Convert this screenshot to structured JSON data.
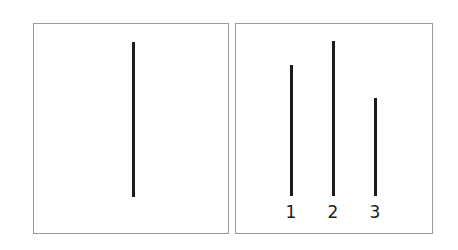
{
  "figure": {
    "background_color": "#ffffff",
    "line_color": "#1c1c1c",
    "panel_border_color": "#9a9a9a",
    "canvas": {
      "width": 458,
      "height": 250
    }
  },
  "panels": [
    {
      "id": "standard",
      "name": "standard-panel",
      "x": 33,
      "y": 23,
      "width": 196,
      "height": 211,
      "lines": [
        {
          "id": "standard-line",
          "label": "",
          "x": 132,
          "top": 42,
          "bottom": 197,
          "length": 155,
          "thickness": 3
        }
      ]
    },
    {
      "id": "comparison",
      "name": "comparison-panel",
      "x": 235,
      "y": 23,
      "width": 198,
      "height": 211,
      "baseline": 196,
      "lines": [
        {
          "id": "comparison-line-1",
          "label": "1",
          "x": 290,
          "top": 65,
          "bottom": 196,
          "length": 131,
          "thickness": 3,
          "label_x": 278,
          "label_y": 202
        },
        {
          "id": "comparison-line-2",
          "label": "2",
          "x": 332,
          "top": 41,
          "bottom": 196,
          "length": 155,
          "thickness": 3,
          "label_x": 320,
          "label_y": 202
        },
        {
          "id": "comparison-line-3",
          "label": "3",
          "x": 374,
          "top": 98,
          "bottom": 196,
          "length": 98,
          "thickness": 3,
          "label_x": 362,
          "label_y": 202
        }
      ]
    }
  ]
}
